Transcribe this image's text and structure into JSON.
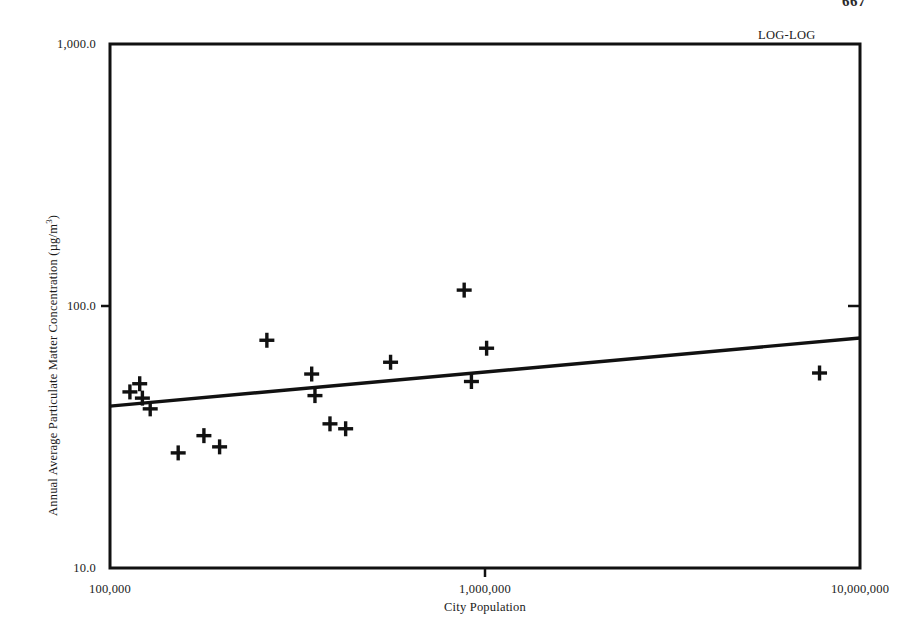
{
  "page": {
    "page_number": "667",
    "background_color": "#ffffff",
    "ink_color": "#1a1a1a"
  },
  "annotations": {
    "scale_note": "LOG-LOG"
  },
  "chart_data": {
    "type": "scatter",
    "title": "",
    "subtitle": "",
    "xlabel": "City Population",
    "ylabel": "Annual Average Particulate Matter Concentration (µg/m³)",
    "ylabel_parts": {
      "text": "Annual Average Particulate Matter Concentration (µg/m",
      "superscript": "3",
      "tail": ")"
    },
    "xscale": "log",
    "yscale": "log",
    "xlim": [
      100000,
      10000000
    ],
    "ylim": [
      10.0,
      1000.0
    ],
    "grid": false,
    "legend": null,
    "marker": "plus-cross",
    "marker_color": "#111111",
    "line_color": "#111111",
    "xticks": [
      {
        "value": 100000,
        "label": "100,000"
      },
      {
        "value": 1000000,
        "label": "1,000,000"
      },
      {
        "value": 10000000,
        "label": "10,000,000"
      }
    ],
    "yticks": [
      {
        "value": 10.0,
        "label": "10.0"
      },
      {
        "value": 100.0,
        "label": "100.0"
      },
      {
        "value": 1000.0,
        "label": "1,000.0"
      }
    ],
    "series": [
      {
        "name": "Cities",
        "type": "scatter",
        "points": [
          {
            "x": 113000,
            "y": 47.0
          },
          {
            "x": 120000,
            "y": 50.5
          },
          {
            "x": 122000,
            "y": 44.5
          },
          {
            "x": 128000,
            "y": 40.5
          },
          {
            "x": 152000,
            "y": 27.5
          },
          {
            "x": 178000,
            "y": 32.0
          },
          {
            "x": 196000,
            "y": 29.0
          },
          {
            "x": 262000,
            "y": 74.0
          },
          {
            "x": 345000,
            "y": 55.0
          },
          {
            "x": 352000,
            "y": 45.5
          },
          {
            "x": 386000,
            "y": 35.5
          },
          {
            "x": 425000,
            "y": 34.0
          },
          {
            "x": 560000,
            "y": 61.0
          },
          {
            "x": 880000,
            "y": 115.0
          },
          {
            "x": 920000,
            "y": 51.5
          },
          {
            "x": 1010000,
            "y": 69.0
          },
          {
            "x": 7800000,
            "y": 55.5
          }
        ]
      },
      {
        "name": "Regression line",
        "type": "line",
        "endpoints": [
          {
            "x": 100000,
            "y": 41.5
          },
          {
            "x": 10000000,
            "y": 75.5
          }
        ]
      }
    ]
  }
}
